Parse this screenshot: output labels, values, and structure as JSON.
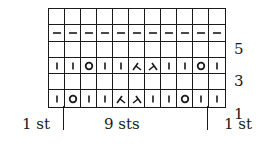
{
  "chart": {
    "columns": 11,
    "rows": [
      {
        "index": 6,
        "label": "",
        "cells": [
          "",
          "",
          "",
          "",
          "",
          "",
          "",
          "",
          "",
          "",
          ""
        ]
      },
      {
        "index": 5,
        "label": "5",
        "cells": [
          "purl",
          "purl",
          "purl",
          "purl",
          "purl",
          "purl",
          "purl",
          "purl",
          "purl",
          "purl",
          "purl"
        ]
      },
      {
        "index": 4,
        "label": "",
        "cells": [
          "",
          "",
          "",
          "",
          "",
          "",
          "",
          "",
          "",
          "",
          ""
        ]
      },
      {
        "index": 3,
        "label": "3",
        "cells": [
          "knit",
          "knit",
          "yo",
          "knit",
          "knit",
          "k2tog",
          "ssk",
          "knit",
          "knit",
          "yo",
          "knit"
        ]
      },
      {
        "index": 2,
        "label": "",
        "cells": [
          "",
          "",
          "",
          "",
          "",
          "",
          "",
          "",
          "",
          "",
          ""
        ]
      },
      {
        "index": 1,
        "label": "1",
        "cells": [
          "knit",
          "yo",
          "knit",
          "knit",
          "k2tog",
          "ssk",
          "knit",
          "knit",
          "yo",
          "knit",
          "knit"
        ]
      }
    ]
  },
  "row_labels": {
    "r5": "5",
    "r3": "3",
    "r1": "1"
  },
  "bottom_labels": {
    "left": "1 st",
    "center": "9 sts",
    "right": "1 st"
  }
}
